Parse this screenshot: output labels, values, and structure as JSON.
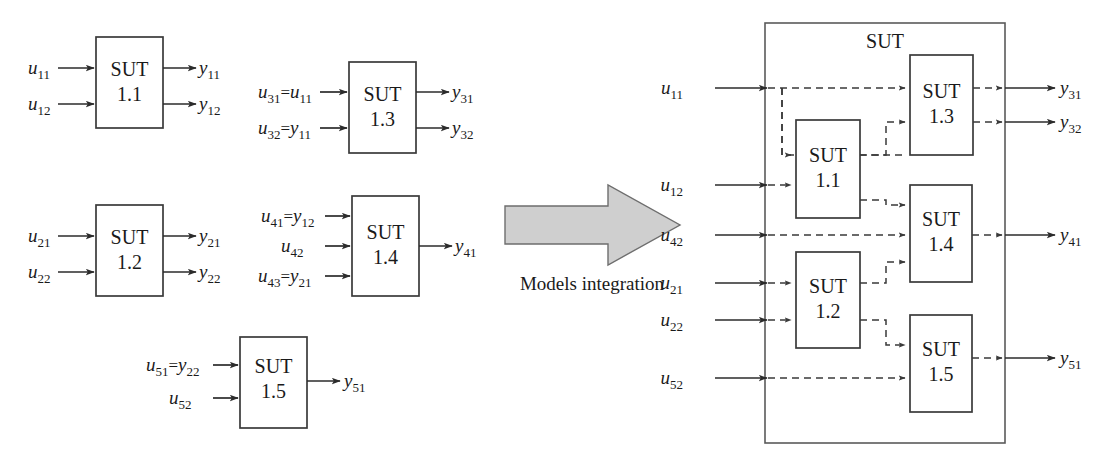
{
  "diagram": {
    "caption": "Models integration",
    "sut_label": "SUT",
    "left_panel": {
      "blocks": [
        {
          "id": "sut11",
          "name": "SUT",
          "number": "1.1",
          "x": 96,
          "y": 37,
          "w": 67,
          "h": 91,
          "inputs": [
            {
              "label": "u",
              "sub": "11",
              "y": 68
            },
            {
              "label": "u",
              "sub": "12",
              "y": 104
            }
          ],
          "outputs": [
            {
              "label": "y",
              "sub": "11",
              "y": 68
            },
            {
              "label": "y",
              "sub": "12",
              "y": 104
            }
          ]
        },
        {
          "id": "sut13",
          "name": "SUT",
          "number": "1.3",
          "x": 349,
          "y": 62,
          "w": 67,
          "h": 91,
          "inputs": [
            {
              "label": "u",
              "sub": "31",
              "eq": "=",
              "src": "u",
              "srcsub": "11",
              "y": 92
            },
            {
              "label": "u",
              "sub": "32",
              "eq": "=",
              "src": "y",
              "srcsub": "11",
              "y": 128
            }
          ],
          "outputs": [
            {
              "label": "y",
              "sub": "31",
              "y": 92
            },
            {
              "label": "y",
              "sub": "32",
              "y": 128
            }
          ]
        },
        {
          "id": "sut12",
          "name": "SUT",
          "number": "1.2",
          "x": 96,
          "y": 205,
          "w": 67,
          "h": 91,
          "inputs": [
            {
              "label": "u",
              "sub": "21",
              "y": 236
            },
            {
              "label": "u",
              "sub": "22",
              "y": 272
            }
          ],
          "outputs": [
            {
              "label": "y",
              "sub": "21",
              "y": 236
            },
            {
              "label": "y",
              "sub": "22",
              "y": 272
            }
          ]
        },
        {
          "id": "sut14",
          "name": "SUT",
          "number": "1.4",
          "x": 352,
          "y": 196,
          "w": 67,
          "h": 100,
          "inputs": [
            {
              "label": "u",
              "sub": "41",
              "eq": "=",
              "src": "y",
              "srcsub": "12",
              "y": 216
            },
            {
              "label": "u",
              "sub": "42",
              "y": 246
            },
            {
              "label": "u",
              "sub": "43",
              "eq": "=",
              "src": "y",
              "srcsub": "21",
              "y": 276
            }
          ],
          "outputs": [
            {
              "label": "y",
              "sub": "41",
              "y": 246
            }
          ]
        },
        {
          "id": "sut15",
          "name": "SUT",
          "number": "1.5",
          "x": 240,
          "y": 337,
          "w": 67,
          "h": 91,
          "inputs": [
            {
              "label": "u",
              "sub": "51",
              "eq": "=",
              "src": "y",
              "srcsub": "22",
              "y": 365
            },
            {
              "label": "u",
              "sub": "52",
              "y": 398
            }
          ],
          "outputs": [
            {
              "label": "y",
              "sub": "51",
              "y": 381
            }
          ]
        }
      ]
    },
    "right_panel": {
      "container": {
        "x": 765,
        "y": 23,
        "w": 240,
        "h": 420,
        "label": "SUT",
        "label_x": 885,
        "label_y": 48
      },
      "blocks": [
        {
          "id": "r_sut11",
          "name": "SUT",
          "number": "1.1",
          "x": 796,
          "y": 120,
          "w": 64,
          "h": 98
        },
        {
          "id": "r_sut12",
          "name": "SUT",
          "number": "1.2",
          "x": 796,
          "y": 252,
          "w": 64,
          "h": 96
        },
        {
          "id": "r_sut13",
          "name": "SUT",
          "number": "1.3",
          "x": 910,
          "y": 55,
          "w": 63,
          "h": 100
        },
        {
          "id": "r_sut14",
          "name": "SUT",
          "number": "1.4",
          "x": 910,
          "y": 185,
          "w": 62,
          "h": 97
        },
        {
          "id": "r_sut15",
          "name": "SUT",
          "number": "1.5",
          "x": 910,
          "y": 315,
          "w": 62,
          "h": 97
        }
      ],
      "inputs": [
        {
          "label": "u",
          "sub": "11",
          "y": 88
        },
        {
          "label": "u",
          "sub": "12",
          "y": 185
        },
        {
          "label": "u",
          "sub": "42",
          "y": 235
        },
        {
          "label": "u",
          "sub": "21",
          "y": 283
        },
        {
          "label": "u",
          "sub": "22",
          "y": 320
        },
        {
          "label": "u",
          "sub": "52",
          "y": 378
        }
      ],
      "outputs": [
        {
          "label": "y",
          "sub": "31",
          "y": 88
        },
        {
          "label": "y",
          "sub": "32",
          "y": 122
        },
        {
          "label": "y",
          "sub": "41",
          "y": 235
        },
        {
          "label": "y",
          "sub": "51",
          "y": 358
        }
      ]
    },
    "arrow": {
      "x": 505,
      "y": 185,
      "w": 175,
      "h": 80,
      "caption_x": 592,
      "caption_y": 290
    }
  }
}
